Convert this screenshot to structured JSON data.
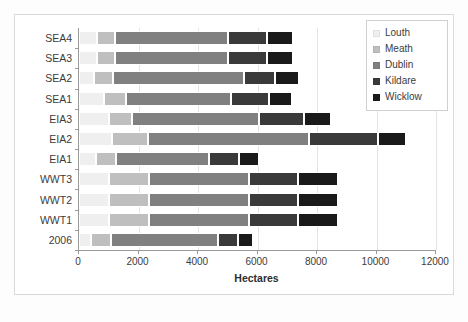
{
  "chart_data": {
    "type": "bar",
    "orientation": "horizontal",
    "stacked": true,
    "title": "",
    "xlabel": "Hectares",
    "ylabel": "",
    "xlim": [
      0,
      12000
    ],
    "xticks": [
      0,
      2000,
      4000,
      6000,
      8000,
      10000,
      12000
    ],
    "grid": true,
    "legend_position": "top-right",
    "categories": [
      "SEA4",
      "SEA3",
      "SEA2",
      "SEA1",
      "EIA3",
      "EIA2",
      "EIA1",
      "WWT3",
      "WWT2",
      "WWT1",
      "2006"
    ],
    "series": [
      {
        "name": "Louth",
        "color": "#efefef",
        "values": [
          600,
          600,
          500,
          840,
          1000,
          1100,
          570,
          1000,
          1000,
          1000,
          400
        ]
      },
      {
        "name": "Meath",
        "color": "#bfbfbf",
        "values": [
          620,
          620,
          640,
          740,
          770,
          1210,
          670,
          1350,
          1350,
          1350,
          670
        ]
      },
      {
        "name": "Dublin",
        "color": "#808080",
        "values": [
          3800,
          3800,
          4400,
          3530,
          4270,
          5410,
          3130,
          3360,
          3360,
          3360,
          3600
        ]
      },
      {
        "name": "Kildare",
        "color": "#3a3a3a",
        "values": [
          1310,
          1310,
          1040,
          1280,
          1510,
          2320,
          1010,
          1650,
          1650,
          1650,
          670
        ]
      },
      {
        "name": "Wicklow",
        "color": "#1a1a1a",
        "values": [
          870,
          870,
          810,
          770,
          910,
          940,
          670,
          1340,
          1340,
          1340,
          500
        ]
      }
    ],
    "totals": [
      7200,
      7200,
      7390,
      7160,
      8460,
      10980,
      6050,
      8700,
      8700,
      8700,
      5840
    ]
  },
  "legend": {
    "items": [
      {
        "label": "Louth",
        "color": "#efefef"
      },
      {
        "label": "Meath",
        "color": "#bfbfbf"
      },
      {
        "label": "Dublin",
        "color": "#808080"
      },
      {
        "label": "Kildare",
        "color": "#3a3a3a"
      },
      {
        "label": "Wicklow",
        "color": "#1a1a1a"
      }
    ]
  },
  "axis": {
    "x_title": "Hectares",
    "x_tick_labels": [
      "0",
      "2000",
      "4000",
      "6000",
      "8000",
      "10000",
      "12000"
    ],
    "y_tick_labels": [
      "SEA4",
      "SEA3",
      "SEA2",
      "SEA1",
      "EIA3",
      "EIA2",
      "EIA1",
      "WWT3",
      "WWT2",
      "WWT1",
      "2006"
    ]
  },
  "caption": ""
}
